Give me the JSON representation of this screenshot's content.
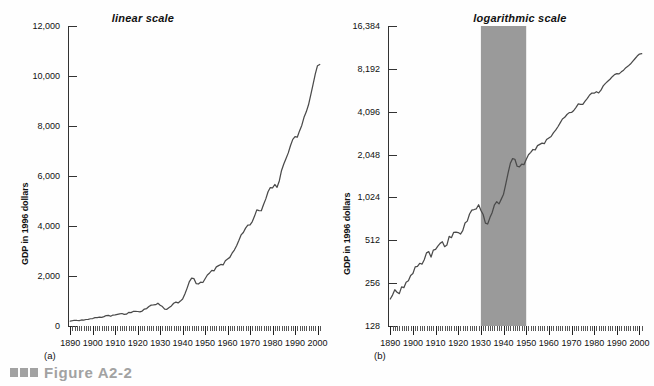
{
  "figure": {
    "caption": "Figure A2-2",
    "marker_color": "#a2a2a2"
  },
  "panels": [
    {
      "letter": "(a)",
      "title": "linear scale",
      "ylabel": "GDP in 1996 dollars",
      "yticks": [
        "0",
        "2,000",
        "4,000",
        "6,000",
        "8,000",
        "10,000",
        "12,000"
      ],
      "xticks": [
        "1890",
        "1900",
        "1910",
        "1920",
        "1930",
        "1940",
        "1950",
        "1960",
        "1970",
        "1980",
        "1990",
        "2000"
      ]
    },
    {
      "letter": "(b)",
      "title": "logarithmic scale",
      "ylabel": "GDP in 1996 dollars",
      "yticks": [
        "128",
        "256",
        "512",
        "1,024",
        "2,048",
        "4,096",
        "8,192",
        "16,384"
      ],
      "xticks": [
        "1890",
        "1900",
        "1910",
        "1920",
        "1930",
        "1940",
        "1950",
        "1960",
        "1970",
        "1980",
        "1990",
        "2000"
      ]
    }
  ],
  "chart_data": [
    {
      "type": "line",
      "title": "linear scale",
      "xlabel": "",
      "ylabel": "GDP in 1996 dollars",
      "xlim": [
        1889,
        2002
      ],
      "ylim": [
        0,
        12000
      ],
      "yticks": [
        0,
        2000,
        4000,
        6000,
        8000,
        10000,
        12000
      ],
      "xticks": [
        1890,
        1900,
        1910,
        1920,
        1930,
        1940,
        1950,
        1960,
        1970,
        1980,
        1990,
        2000
      ],
      "grid": false,
      "legend": false,
      "line_color": "#4a4a4a",
      "series": [
        {
          "name": "Real GDP (billions of 1996 dollars)",
          "x": [
            1890,
            1891,
            1892,
            1893,
            1894,
            1895,
            1896,
            1897,
            1898,
            1899,
            1900,
            1901,
            1902,
            1903,
            1904,
            1905,
            1906,
            1907,
            1908,
            1909,
            1910,
            1911,
            1912,
            1913,
            1914,
            1915,
            1916,
            1917,
            1918,
            1919,
            1920,
            1921,
            1922,
            1923,
            1924,
            1925,
            1926,
            1927,
            1928,
            1929,
            1930,
            1931,
            1932,
            1933,
            1934,
            1935,
            1936,
            1937,
            1938,
            1939,
            1940,
            1941,
            1942,
            1943,
            1944,
            1945,
            1946,
            1947,
            1948,
            1949,
            1950,
            1951,
            1952,
            1953,
            1954,
            1955,
            1956,
            1957,
            1958,
            1959,
            1960,
            1961,
            1962,
            1963,
            1964,
            1965,
            1966,
            1967,
            1968,
            1969,
            1970,
            1971,
            1972,
            1973,
            1974,
            1975,
            1976,
            1977,
            1978,
            1979,
            1980,
            1981,
            1982,
            1983,
            1984,
            1985,
            1986,
            1987,
            1988,
            1989,
            1990,
            1991,
            1992,
            1993,
            1994,
            1995,
            1996,
            1997,
            1998,
            1999,
            2000,
            2001
          ],
          "y": [
            198,
            211,
            230,
            221,
            216,
            241,
            238,
            260,
            266,
            290,
            299,
            333,
            336,
            353,
            348,
            374,
            418,
            426,
            390,
            437,
            442,
            466,
            487,
            500,
            462,
            474,
            545,
            534,
            582,
            584,
            580,
            566,
            598,
            677,
            698,
            783,
            834,
            842,
            852,
            910,
            831,
            777,
            676,
            666,
            739,
            804,
            909,
            955,
            922,
            996,
            1080,
            1277,
            1516,
            1777,
            1918,
            1899,
            1696,
            1680,
            1752,
            1740,
            1890,
            2042,
            2123,
            2223,
            2209,
            2366,
            2415,
            2463,
            2442,
            2611,
            2679,
            2745,
            2912,
            3039,
            3213,
            3420,
            3643,
            3740,
            3916,
            4037,
            4044,
            4177,
            4396,
            4644,
            4618,
            4610,
            4862,
            5085,
            5368,
            5538,
            5523,
            5661,
            5549,
            5801,
            6223,
            6480,
            6696,
            6925,
            7219,
            7466,
            7578,
            7552,
            7804,
            8022,
            8348,
            8566,
            8848,
            9248,
            9652,
            10077,
            10413,
            10461
          ]
        }
      ]
    },
    {
      "type": "line",
      "title": "logarithmic scale",
      "xlabel": "",
      "ylabel": "GDP in 1996 dollars",
      "xlim": [
        1889,
        2002
      ],
      "ylim": [
        128,
        16384
      ],
      "yscale": "log2",
      "yticks": [
        128,
        256,
        512,
        1024,
        2048,
        4096,
        8192,
        16384
      ],
      "xticks": [
        1890,
        1900,
        1910,
        1920,
        1930,
        1940,
        1950,
        1960,
        1970,
        1980,
        1990,
        2000
      ],
      "grid": false,
      "legend": false,
      "line_color": "#4a4a4a",
      "shaded_region": {
        "x_start": 1930,
        "x_end": 1950,
        "color": "#9a9a9a"
      },
      "series": [
        {
          "name": "Real GDP (billions of 1996 dollars)",
          "x": [
            1890,
            1891,
            1892,
            1893,
            1894,
            1895,
            1896,
            1897,
            1898,
            1899,
            1900,
            1901,
            1902,
            1903,
            1904,
            1905,
            1906,
            1907,
            1908,
            1909,
            1910,
            1911,
            1912,
            1913,
            1914,
            1915,
            1916,
            1917,
            1918,
            1919,
            1920,
            1921,
            1922,
            1923,
            1924,
            1925,
            1926,
            1927,
            1928,
            1929,
            1930,
            1931,
            1932,
            1933,
            1934,
            1935,
            1936,
            1937,
            1938,
            1939,
            1940,
            1941,
            1942,
            1943,
            1944,
            1945,
            1946,
            1947,
            1948,
            1949,
            1950,
            1951,
            1952,
            1953,
            1954,
            1955,
            1956,
            1957,
            1958,
            1959,
            1960,
            1961,
            1962,
            1963,
            1964,
            1965,
            1966,
            1967,
            1968,
            1969,
            1970,
            1971,
            1972,
            1973,
            1974,
            1975,
            1976,
            1977,
            1978,
            1979,
            1980,
            1981,
            1982,
            1983,
            1984,
            1985,
            1986,
            1987,
            1988,
            1989,
            1990,
            1991,
            1992,
            1993,
            1994,
            1995,
            1996,
            1997,
            1998,
            1999,
            2000,
            2001
          ],
          "y": [
            198,
            211,
            230,
            221,
            216,
            241,
            238,
            260,
            266,
            290,
            299,
            333,
            336,
            353,
            348,
            374,
            418,
            426,
            390,
            437,
            442,
            466,
            487,
            500,
            462,
            474,
            545,
            534,
            582,
            584,
            580,
            566,
            598,
            677,
            698,
            783,
            834,
            842,
            852,
            910,
            831,
            777,
            676,
            666,
            739,
            804,
            909,
            955,
            922,
            996,
            1080,
            1277,
            1516,
            1777,
            1918,
            1899,
            1696,
            1680,
            1752,
            1740,
            1890,
            2042,
            2123,
            2223,
            2209,
            2366,
            2415,
            2463,
            2442,
            2611,
            2679,
            2745,
            2912,
            3039,
            3213,
            3420,
            3643,
            3740,
            3916,
            4037,
            4044,
            4177,
            4396,
            4644,
            4618,
            4610,
            4862,
            5085,
            5368,
            5538,
            5523,
            5661,
            5549,
            5801,
            6223,
            6480,
            6696,
            6925,
            7219,
            7466,
            7578,
            7552,
            7804,
            8022,
            8348,
            8566,
            8848,
            9248,
            9652,
            10077,
            10413,
            10461
          ]
        }
      ]
    }
  ]
}
